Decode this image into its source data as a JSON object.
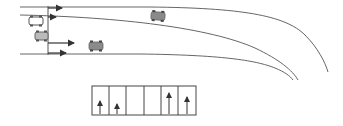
{
  "diagram": {
    "title": "",
    "colors": {
      "line": "#555555",
      "car_fill": "#8a8a8a",
      "car_outline_fill": "#ffffff",
      "arrow": "#333333",
      "box_border": "#444444"
    },
    "road": {
      "curves": [
        "top-edge",
        "center-divider",
        "bottom-edge"
      ],
      "stop_line": "vertical-line"
    },
    "cars": [
      {
        "id": "car-1",
        "style": "outline",
        "x": 29,
        "y": 18
      },
      {
        "id": "car-2",
        "style": "light",
        "x": 39,
        "y": 36
      },
      {
        "id": "car-3",
        "style": "filled",
        "x": 96,
        "y": 46
      },
      {
        "id": "car-4",
        "style": "filled",
        "x": 158,
        "y": 16
      }
    ],
    "arrows": [
      {
        "id": "arrow-lane-1",
        "direction": "right"
      },
      {
        "id": "arrow-lane-2",
        "direction": "right"
      },
      {
        "id": "arrow-lane-3",
        "direction": "right"
      },
      {
        "id": "arrow-lane-4",
        "direction": "right"
      }
    ],
    "grid": {
      "cells": 6,
      "cell_arrows": [
        "up",
        "up",
        "none",
        "none",
        "up",
        "up"
      ]
    }
  }
}
